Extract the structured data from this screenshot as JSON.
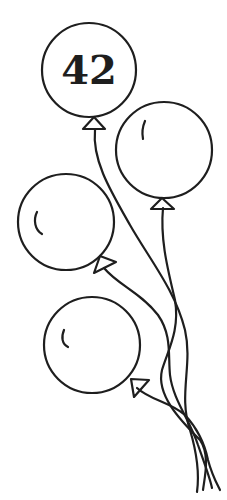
{
  "illustration": {
    "title": "Balloons",
    "stroke_color": "#1e1e1e",
    "background_color": "#ffffff",
    "balloons": [
      {
        "id": "balloon-1",
        "label": "42",
        "has_highlight": false
      },
      {
        "id": "balloon-2",
        "label": "",
        "has_highlight": true
      },
      {
        "id": "balloon-3",
        "label": "",
        "has_highlight": true
      },
      {
        "id": "balloon-4",
        "label": "",
        "has_highlight": true
      }
    ],
    "strings_count": 4
  }
}
